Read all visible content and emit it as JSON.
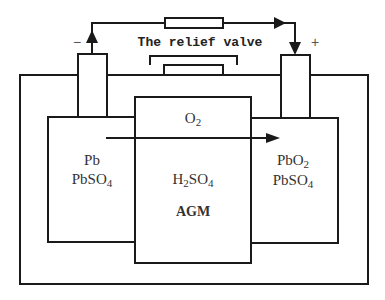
{
  "diagram": {
    "valve_label": "The relief valve",
    "negative_terminal_sign": "−",
    "positive_terminal_sign": "+",
    "negative_plate": {
      "line1": "Pb",
      "line2": "PbSO",
      "line2_sub": "4"
    },
    "positive_plate": {
      "line1": "PbO",
      "line1_sub": "2",
      "line2": "PbSO",
      "line2_sub": "4"
    },
    "separator": {
      "gas": "O",
      "gas_sub": "2",
      "electrolyte_a": "H",
      "electrolyte_sub_a": "2",
      "electrolyte_b": "SO",
      "electrolyte_sub_b": "4",
      "material": "AGM"
    },
    "flows": [
      {
        "name": "external-current",
        "from": "negative-terminal",
        "to": "positive-terminal"
      },
      {
        "name": "oxygen-migration",
        "from": "negative-plate",
        "to": "positive-plate"
      }
    ]
  }
}
